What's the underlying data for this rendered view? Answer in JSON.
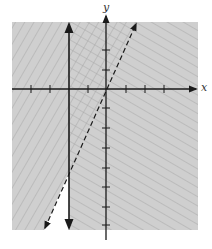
{
  "figure": {
    "type": "graph of system of linear inequalities",
    "axes": {
      "x_label": "x",
      "y_label": "y",
      "tick_spacing_px": 19
    },
    "lines": [
      {
        "name": "vertical-boundary",
        "style": "solid",
        "description": "x = -2 (vertical solid line with arrows)"
      },
      {
        "name": "dashed-boundary",
        "style": "dashed",
        "description": "dashed line with positive slope through near origin"
      }
    ],
    "regions": [
      {
        "name": "left-of-vertical",
        "hatch": "diagonal up-right"
      },
      {
        "name": "right-of-dashed",
        "hatch": "diagonal down-right"
      },
      {
        "name": "overlap",
        "hatch": "crosshatch"
      }
    ],
    "colors": {
      "shade": "#c8c8c8",
      "hatch": "#9a9a9a",
      "axis": "#1a1a1a",
      "background": "#ffffff"
    }
  }
}
